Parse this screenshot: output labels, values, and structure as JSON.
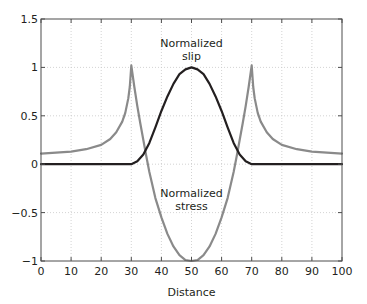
{
  "chart_data": {
    "type": "line",
    "title": "",
    "xlabel": "Distance",
    "ylabel": "",
    "xlim": [
      0,
      100
    ],
    "ylim": [
      -1,
      1.5
    ],
    "grid": true,
    "legend": "none",
    "x_ticks": [
      0,
      10,
      20,
      30,
      40,
      50,
      60,
      70,
      80,
      90,
      100
    ],
    "y_ticks": [
      -1,
      -0.5,
      0,
      0.5,
      1,
      1.5
    ],
    "y_tick_labels": [
      "−1",
      "−0.5",
      "0",
      "0.5",
      "1",
      "1.5"
    ],
    "annotations": [
      {
        "lines": [
          "Normalized",
          "slip"
        ],
        "x": 50,
        "y": 1.18
      },
      {
        "lines": [
          "Normalized",
          "stress"
        ],
        "x": 50,
        "y": -0.42
      }
    ],
    "series": [
      {
        "name": "Normalized slip",
        "color": "#231f20",
        "x": [
          0,
          10,
          20,
          30,
          32,
          34,
          36,
          38,
          40,
          42,
          44,
          46,
          48,
          50,
          52,
          54,
          56,
          58,
          60,
          62,
          64,
          66,
          68,
          70,
          80,
          90,
          100
        ],
        "values": [
          0,
          0,
          0,
          0,
          0.03,
          0.1,
          0.22,
          0.38,
          0.55,
          0.7,
          0.83,
          0.93,
          0.98,
          1.0,
          0.98,
          0.93,
          0.83,
          0.7,
          0.55,
          0.38,
          0.22,
          0.1,
          0.03,
          0,
          0,
          0,
          0
        ]
      },
      {
        "name": "Normalized stress",
        "color": "#8a8a8a",
        "x": [
          0,
          5,
          10,
          15,
          20,
          23,
          25,
          27,
          28,
          29,
          29.5,
          30,
          31,
          32,
          33,
          34,
          35,
          36,
          38,
          40,
          42,
          44,
          46,
          48,
          50,
          52,
          54,
          56,
          58,
          60,
          62,
          64,
          65,
          66,
          67,
          68,
          69,
          70,
          70.5,
          71,
          72,
          73,
          75,
          77,
          80,
          85,
          90,
          95,
          100
        ],
        "values": [
          0.11,
          0.12,
          0.13,
          0.155,
          0.2,
          0.26,
          0.33,
          0.44,
          0.53,
          0.68,
          0.8,
          1.02,
          0.8,
          0.6,
          0.42,
          0.25,
          0.08,
          -0.08,
          -0.35,
          -0.55,
          -0.72,
          -0.85,
          -0.94,
          -0.99,
          -1.0,
          -0.99,
          -0.94,
          -0.85,
          -0.72,
          -0.55,
          -0.35,
          -0.08,
          0.08,
          0.25,
          0.42,
          0.6,
          0.8,
          1.02,
          0.8,
          0.68,
          0.53,
          0.44,
          0.33,
          0.26,
          0.2,
          0.155,
          0.13,
          0.12,
          0.11
        ]
      }
    ]
  },
  "plot": {
    "x_axis_label": "Distance",
    "slip_label_line1": "Normalized",
    "slip_label_line2": "slip",
    "stress_label_line1": "Normalized",
    "stress_label_line2": "stress"
  }
}
